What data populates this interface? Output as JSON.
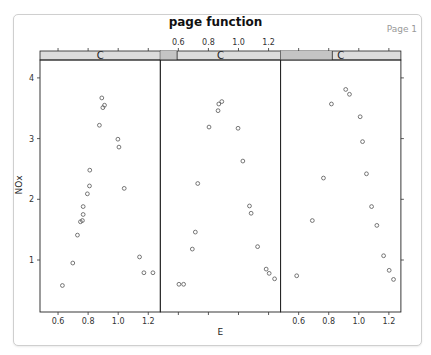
{
  "header": {
    "title": "page function",
    "page_label": "Page 1"
  },
  "colors": {
    "strip_bg": "#dcdcdc",
    "strip_indicator": "#c4c4c4",
    "panel_border": "#222222",
    "point": "#555555",
    "frame_border": "#cfcfcf"
  },
  "chart_data": {
    "type": "scatter",
    "title": "page function",
    "xlabel": "E",
    "ylabel": "NOx",
    "xlim": [
      0.48,
      1.28
    ],
    "ylim": [
      0.43,
      4.3
    ],
    "x_ticks": [
      "0.6",
      "0.8",
      "1.0",
      "1.2"
    ],
    "x_tick_values": [
      0.6,
      0.8,
      1.0,
      1.2
    ],
    "y_ticks": [
      "1",
      "2",
      "3",
      "4"
    ],
    "y_tick_values": [
      1,
      2,
      3,
      4
    ],
    "x_tick_label_positions": [
      "bottom",
      "top",
      "bottom"
    ],
    "grid": false,
    "panels": [
      {
        "strip_label": "C",
        "strip_indicator": [
          0.0,
          0.0
        ],
        "points": [
          [
            0.891,
            3.67
          ],
          [
            0.909,
            3.55
          ],
          [
            0.898,
            3.51
          ],
          [
            0.875,
            3.22
          ],
          [
            0.998,
            2.99
          ],
          [
            1.005,
            2.86
          ],
          [
            0.811,
            2.48
          ],
          [
            0.809,
            2.22
          ],
          [
            1.04,
            2.18
          ],
          [
            0.795,
            2.09
          ],
          [
            0.767,
            1.88
          ],
          [
            0.767,
            1.75
          ],
          [
            0.762,
            1.65
          ],
          [
            0.749,
            1.63
          ],
          [
            0.729,
            1.41
          ],
          [
            0.698,
            0.95
          ],
          [
            1.142,
            1.05
          ],
          [
            1.171,
            0.79
          ],
          [
            1.231,
            0.79
          ],
          [
            0.629,
            0.58
          ]
        ]
      },
      {
        "strip_label": "C",
        "strip_indicator": [
          0.0,
          0.14
        ],
        "points": [
          [
            0.889,
            3.61
          ],
          [
            0.869,
            3.57
          ],
          [
            0.864,
            3.46
          ],
          [
            0.804,
            3.19
          ],
          [
            0.997,
            3.17
          ],
          [
            1.029,
            2.63
          ],
          [
            0.729,
            2.26
          ],
          [
            1.073,
            1.89
          ],
          [
            1.084,
            1.77
          ],
          [
            0.713,
            1.46
          ],
          [
            0.693,
            1.18
          ],
          [
            1.127,
            1.22
          ],
          [
            1.184,
            0.85
          ],
          [
            1.204,
            0.78
          ],
          [
            1.24,
            0.69
          ],
          [
            0.604,
            0.6
          ],
          [
            0.635,
            0.6
          ]
        ]
      },
      {
        "strip_label": "C",
        "strip_indicator": [
          0.0,
          0.43
        ],
        "points": [
          [
            0.913,
            3.81
          ],
          [
            0.938,
            3.73
          ],
          [
            0.818,
            3.57
          ],
          [
            1.009,
            3.36
          ],
          [
            1.025,
            2.95
          ],
          [
            1.051,
            2.42
          ],
          [
            0.765,
            2.35
          ],
          [
            1.085,
            1.88
          ],
          [
            0.691,
            1.65
          ],
          [
            1.12,
            1.57
          ],
          [
            1.165,
            1.07
          ],
          [
            1.202,
            0.83
          ],
          [
            1.231,
            0.68
          ],
          [
            0.587,
            0.74
          ]
        ]
      }
    ]
  }
}
